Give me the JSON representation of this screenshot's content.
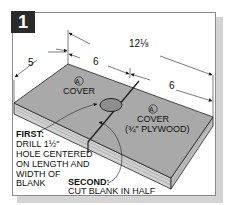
{
  "figure": {
    "step_number": "1",
    "dimensions": {
      "overall_length": "12⅛",
      "left_width": "5",
      "left_half": "6",
      "right_half": "6"
    },
    "parts": [
      {
        "marker": "A",
        "label": "COVER",
        "sublabel": ""
      },
      {
        "marker": "A",
        "label": "COVER",
        "sublabel": "(¾\" PLYWOOD)"
      }
    ],
    "callouts": {
      "first_title": "FIRST:",
      "first_lines": [
        "DRILL 1½\"",
        "HOLE CENTERED",
        "ON LENGTH AND",
        "WIDTH OF",
        "BLANK"
      ],
      "second_title": "SECOND:",
      "second_text": "CUT BLANK IN HALF"
    },
    "colors": {
      "board_top": "#a9a9a9",
      "board_edge": "#c8c8c8",
      "badge": "#2a2a2a",
      "shadow": "#d4d4d4"
    }
  }
}
